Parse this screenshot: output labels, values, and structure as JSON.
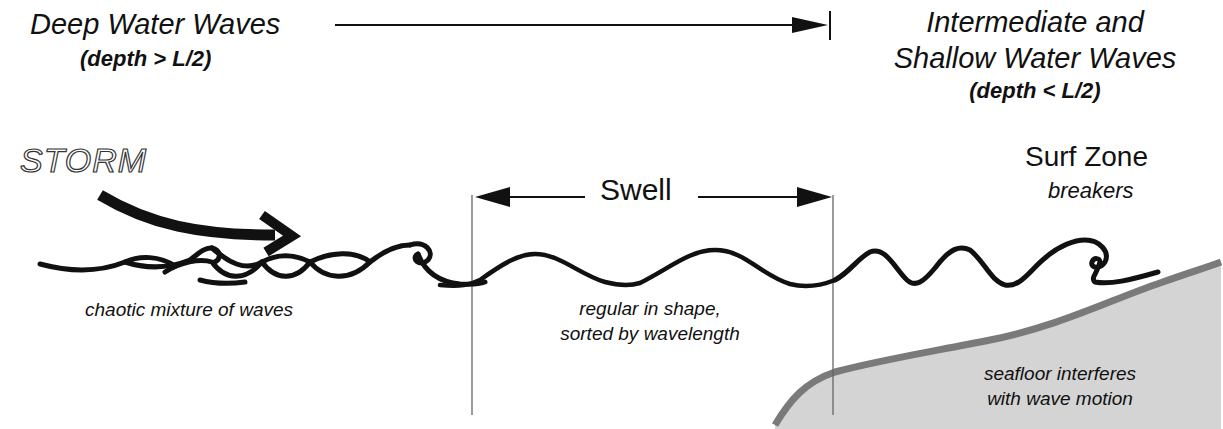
{
  "diagram": {
    "zones": {
      "deep": {
        "title": "Deep Water Waves",
        "condition": "(depth > L/2)"
      },
      "shallow": {
        "title_line1": "Intermediate and",
        "title_line2": "Shallow Water Waves",
        "condition": "(depth < L/2)"
      }
    },
    "storm": {
      "label": "STORM",
      "caption": "chaotic mixture of waves"
    },
    "swell": {
      "label": "Swell",
      "caption_line1": "regular in shape,",
      "caption_line2": "sorted by wavelength"
    },
    "surf_zone": {
      "title": "Surf Zone",
      "subtitle": "breakers"
    },
    "seafloor": {
      "caption_line1": "seafloor interferes",
      "caption_line2": "with wave motion"
    },
    "colors": {
      "ink": "#111111",
      "seafloor_fill": "#d4d4d4",
      "seafloor_edge": "#7a7a7a",
      "guide_line": "#666666"
    }
  }
}
